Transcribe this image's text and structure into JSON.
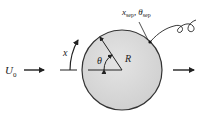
{
  "diagram": {
    "labels": {
      "freestream": "U",
      "freestream_sub": "0",
      "arc_coordinate": "x",
      "angle": "θ",
      "radius": "R",
      "separation_x": "x",
      "separation_x_sub": "sep",
      "separation_sep": ",",
      "separation_theta": "θ",
      "separation_theta_sub": "sep"
    },
    "colors": {
      "cylinder_fill": "#d6d6d6",
      "cylinder_stroke": "#333333",
      "line": "#222222"
    }
  }
}
